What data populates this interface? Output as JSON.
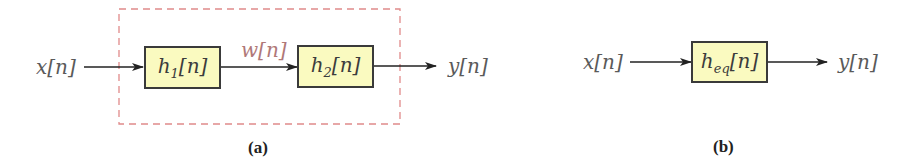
{
  "diagram_a": {
    "input_label": "x[n]",
    "block1": {
      "base": "h",
      "sub": "1",
      "arg": "[n]"
    },
    "intermediate_label": "w[n]",
    "block2": {
      "base": "h",
      "sub": "2",
      "arg": "[n]"
    },
    "output_label": "y[n]",
    "caption": "(a)",
    "dashed_box_color": "#e08a8a",
    "intermediate_color": "#b07878"
  },
  "diagram_b": {
    "input_label": "x[n]",
    "block": {
      "base": "h",
      "sub": "eq",
      "arg": "[n]"
    },
    "output_label": "y[n]",
    "caption": "(b)"
  },
  "colors": {
    "block_fill": "#fafac0",
    "block_border": "#3a3a3a",
    "arrow": "#222222",
    "text": "#5a5a5a"
  }
}
